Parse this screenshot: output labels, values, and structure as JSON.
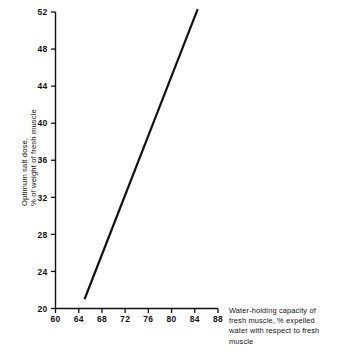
{
  "figure": {
    "background_color": "#ffffff",
    "line_color": "#111111",
    "axis_color": "#111111"
  },
  "axes": {
    "y_title_line1": "Optimum salt dose,",
    "y_title_line2": "% of weight of fresh muscle",
    "x_title_line1": "Water-holding capacity of",
    "x_title_line2": "fresh muscle, % expelled",
    "x_title_line3": "water with respect to fresh",
    "x_title_line4": "muscle"
  },
  "ticks": {
    "y": [
      "52",
      "48",
      "44",
      "40",
      "36",
      "32",
      "28",
      "24",
      "20"
    ],
    "x": [
      "60",
      "64",
      "68",
      "72",
      "76",
      "80",
      "84",
      "88"
    ]
  },
  "chart_data": {
    "type": "line",
    "title": "",
    "xlabel": "Water-holding capacity of fresh muscle, % expelled water with respect to fresh muscle",
    "ylabel": "Optimum salt dose, % of weight of fresh muscle",
    "xlim": [
      60,
      88
    ],
    "ylim": [
      20,
      52
    ],
    "xticks": [
      60,
      64,
      68,
      72,
      76,
      80,
      84,
      88
    ],
    "yticks": [
      20,
      24,
      28,
      32,
      36,
      40,
      44,
      48,
      52
    ],
    "grid": false,
    "legend": false,
    "series": [
      {
        "name": "Optimum salt dose vs water-holding capacity",
        "x": [
          65.0,
          84.5
        ],
        "y": [
          21.0,
          52.3
        ]
      }
    ]
  }
}
